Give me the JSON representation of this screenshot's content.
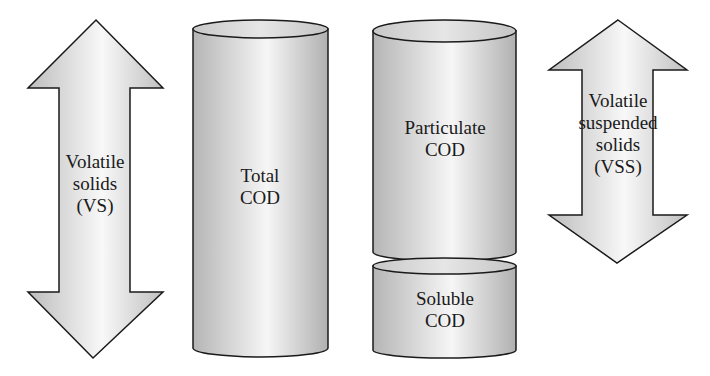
{
  "diagram": {
    "left_arrow": {
      "lines": [
        "Volatile",
        "solids",
        "(VS)"
      ]
    },
    "total_cod": {
      "lines": [
        "Total",
        "COD"
      ]
    },
    "particulate_cod": {
      "lines": [
        "Particulate",
        "COD"
      ]
    },
    "soluble_cod": {
      "lines": [
        "Soluble",
        "COD"
      ]
    },
    "right_arrow": {
      "lines": [
        "Volatile",
        "suspended",
        "solids",
        "(VSS)"
      ]
    }
  },
  "colors": {
    "stroke": "#1a1a1a",
    "fill_dark": "#b8b8b8",
    "fill_light": "#f4f4f4"
  }
}
